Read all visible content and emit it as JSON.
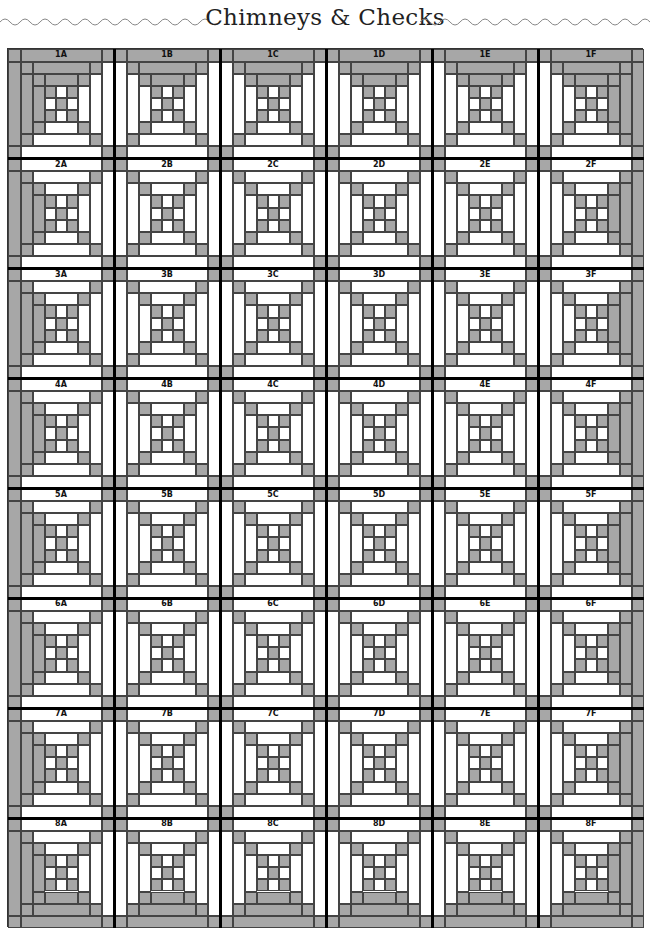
{
  "header": {
    "title": "Chimneys & Checks"
  },
  "quilt": {
    "rows": 8,
    "columns": 6,
    "row_labels": [
      "1",
      "2",
      "3",
      "4",
      "5",
      "6",
      "7",
      "8"
    ],
    "column_labels": [
      "A",
      "B",
      "C",
      "D",
      "E",
      "F"
    ],
    "blocks": [
      [
        "1A",
        "1B",
        "1C",
        "1D",
        "1E",
        "1F"
      ],
      [
        "2A",
        "2B",
        "2C",
        "2D",
        "2E",
        "2F"
      ],
      [
        "3A",
        "3B",
        "3C",
        "3D",
        "3E",
        "3F"
      ],
      [
        "4A",
        "4B",
        "4C",
        "4D",
        "4E",
        "4F"
      ],
      [
        "5A",
        "5B",
        "5C",
        "5D",
        "5E",
        "5F"
      ],
      [
        "6A",
        "6B",
        "6C",
        "6D",
        "6E",
        "6F"
      ],
      [
        "7A",
        "7B",
        "7C",
        "7D",
        "7E",
        "7F"
      ],
      [
        "8A",
        "8B",
        "8C",
        "8D",
        "8E",
        "8F"
      ]
    ],
    "block_pattern": "Courthouse steps log cabin with nine-patch center",
    "colors": {
      "gray_fabric": "#a7a7a7",
      "light_fabric": "#ffffff",
      "seam_line": "#444444",
      "divider_line": "#000000"
    }
  }
}
